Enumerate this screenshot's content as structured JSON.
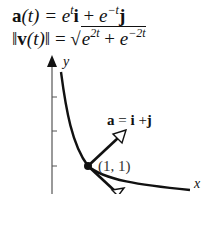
{
  "equations": {
    "accel": {
      "lhs_bold": "a",
      "lhs_rest": "(t) = ",
      "base1": "e",
      "exp1": "t",
      "vec1": "i",
      "plus": " + ",
      "base2": "e",
      "exp2": "−t",
      "vec2": "j"
    },
    "speed": {
      "open": "‖",
      "lhs_bold": "v",
      "lhs_rest": "(t)",
      "close": "‖",
      "eq": " = ",
      "radical": "√",
      "base1": "e",
      "exp1": "2t",
      "plus": " + ",
      "base2": "e",
      "exp2": "−2t"
    }
  },
  "diagram": {
    "axis_labels": {
      "x": "x",
      "y": "y"
    },
    "point_label": "(1, 1)",
    "vector_label": {
      "bold_a": "a",
      "eq": " = ",
      "bold_i": "i",
      "plus": " +",
      "bold_j": "j"
    },
    "curve": "y = 1/x (x = e^t, y = e^-t)",
    "point": [
      1,
      1
    ],
    "acceleration_vector": [
      1,
      1
    ],
    "velocity_vector": [
      1,
      -1
    ],
    "colors": {
      "ink": "#111111",
      "axis": "#555555",
      "background": "#ffffff"
    }
  }
}
